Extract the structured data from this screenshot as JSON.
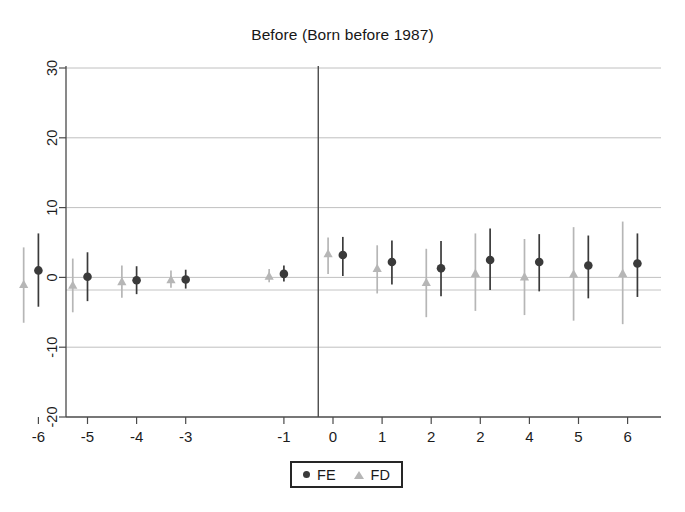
{
  "chart_data": {
    "type": "scatter",
    "title": "Before (Born before 1987)",
    "xlabel": "",
    "ylabel": "",
    "xlim": [
      -6.9,
      6.9
    ],
    "ylim": [
      -20,
      31
    ],
    "grid": true,
    "grid_axis": "y",
    "legend_position": "bottom-center",
    "x_tick_labels": [
      "-6",
      "-5",
      "-4",
      "-3",
      "-1",
      "0",
      "1",
      "2",
      "2",
      "4",
      "5",
      "6"
    ],
    "x_tick_values": [
      -6,
      -5,
      -4,
      -3,
      -1,
      0,
      1,
      2,
      3,
      4,
      5,
      6
    ],
    "y_tick_labels": [
      "-20",
      "-10",
      "0",
      "10",
      "20",
      "30"
    ],
    "y_tick_values": [
      -20,
      -10,
      0,
      10,
      20,
      30
    ],
    "vertical_reference_x": -0.3,
    "series": [
      {
        "name": "FE",
        "marker": "circle",
        "color": "#3a3a3a",
        "points": [
          {
            "x": -6,
            "y": 1.0,
            "lo": -4.2,
            "hi": 6.3
          },
          {
            "x": -5,
            "y": 0.1,
            "lo": -3.4,
            "hi": 3.6
          },
          {
            "x": -4,
            "y": -0.4,
            "lo": -2.4,
            "hi": 1.6
          },
          {
            "x": -3,
            "y": -0.3,
            "lo": -1.6,
            "hi": 1.1
          },
          {
            "x": -1,
            "y": 0.5,
            "lo": -0.6,
            "hi": 1.7
          },
          {
            "x": 0.2,
            "y": 3.2,
            "lo": 0.2,
            "hi": 5.8
          },
          {
            "x": 1.2,
            "y": 2.2,
            "lo": -1.0,
            "hi": 5.3
          },
          {
            "x": 2.2,
            "y": 1.3,
            "lo": -2.7,
            "hi": 5.2
          },
          {
            "x": 3.2,
            "y": 2.5,
            "lo": -1.8,
            "hi": 7.0
          },
          {
            "x": 4.2,
            "y": 2.2,
            "lo": -2.0,
            "hi": 6.2
          },
          {
            "x": 5.2,
            "y": 1.7,
            "lo": -3.0,
            "hi": 6.0
          },
          {
            "x": 6.2,
            "y": 2.0,
            "lo": -2.8,
            "hi": 6.3
          }
        ]
      },
      {
        "name": "FD",
        "marker": "triangle",
        "color": "#b6b6b6",
        "points": [
          {
            "x": -6.3,
            "y": -1.0,
            "lo": -6.5,
            "hi": 4.3
          },
          {
            "x": -5.3,
            "y": -1.1,
            "lo": -5.0,
            "hi": 2.7
          },
          {
            "x": -4.3,
            "y": -0.6,
            "lo": -2.9,
            "hi": 1.7
          },
          {
            "x": -3.3,
            "y": -0.3,
            "lo": -1.5,
            "hi": 1.0
          },
          {
            "x": -1.3,
            "y": 0.2,
            "lo": -0.7,
            "hi": 1.2
          },
          {
            "x": -0.1,
            "y": 3.4,
            "lo": 0.5,
            "hi": 5.7
          },
          {
            "x": 0.9,
            "y": 1.3,
            "lo": -2.3,
            "hi": 4.6
          },
          {
            "x": 1.9,
            "y": -0.7,
            "lo": -5.7,
            "hi": 4.1
          },
          {
            "x": 2.9,
            "y": 0.6,
            "lo": -4.8,
            "hi": 6.3
          },
          {
            "x": 3.9,
            "y": 0.1,
            "lo": -5.4,
            "hi": 5.5
          },
          {
            "x": 4.9,
            "y": 0.5,
            "lo": -6.2,
            "hi": 7.2
          },
          {
            "x": 5.9,
            "y": 0.6,
            "lo": -6.7,
            "hi": 8.0
          }
        ]
      }
    ]
  },
  "legend": {
    "items": [
      {
        "label": "FE",
        "marker": "circle",
        "color": "#3a3a3a"
      },
      {
        "label": "FD",
        "marker": "triangle",
        "color": "#b6b6b6"
      }
    ]
  },
  "colors": {
    "fe": "#3a3a3a",
    "fd": "#b6b6b6",
    "grid": "#b9b9b9",
    "axis": "#4a4a4a",
    "background": "#ffffff"
  }
}
